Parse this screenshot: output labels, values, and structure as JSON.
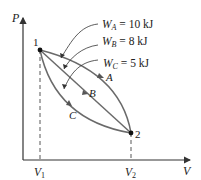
{
  "axes": {
    "y_label": "P",
    "x_label": "V"
  },
  "ticks": {
    "v1_main": "V",
    "v1_sub": "1",
    "v2_main": "V",
    "v2_sub": "2"
  },
  "points": {
    "p1": "1",
    "p2": "2"
  },
  "paths": {
    "a": "A",
    "b": "B",
    "c": "C"
  },
  "work": {
    "a": {
      "w": "W",
      "sub": "A",
      "value": " = 10 kJ"
    },
    "b": {
      "w": "W",
      "sub": "B",
      "value": " = 8 kJ"
    },
    "c": {
      "w": "W",
      "sub": "C",
      "value": " = 5 kJ"
    }
  },
  "colors": {
    "curve": "#6a6a6a",
    "axis": "#333333",
    "accent": "#c0392b"
  }
}
